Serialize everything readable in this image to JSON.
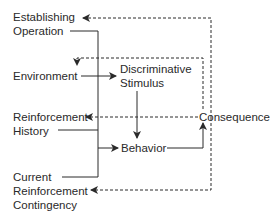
{
  "diagram": {
    "nodes": {
      "establishing_operation": {
        "line1": "Establishing",
        "line2": "Operation"
      },
      "environment": {
        "label": "Environment"
      },
      "discriminative_stimulus": {
        "line1": "Discriminative",
        "line2": "Stimulus"
      },
      "reinforcement_history": {
        "line1": "Reinforcement",
        "line2": "History"
      },
      "behavior": {
        "label": "Behavior"
      },
      "consequence": {
        "label": "Consequence"
      },
      "current_reinforcement_contingency": {
        "line1": "Current",
        "line2": "Reinforcement",
        "line3": "Contingency"
      }
    },
    "edges": [
      {
        "from": "Environment",
        "to": "Discriminative Stimulus",
        "style": "solid"
      },
      {
        "from": "Discriminative Stimulus",
        "to": "Behavior",
        "style": "solid"
      },
      {
        "from": "Establishing Operation / Reinforcement History / Current Reinforcement Contingency",
        "to": "Behavior",
        "style": "solid"
      },
      {
        "from": "Behavior",
        "to": "Consequence",
        "style": "solid"
      },
      {
        "from": "Consequence",
        "to": "Establishing Operation",
        "style": "dashed"
      },
      {
        "from": "Consequence",
        "to": "Environment",
        "style": "dashed"
      },
      {
        "from": "Consequence",
        "to": "Reinforcement History",
        "style": "dashed"
      },
      {
        "from": "Consequence",
        "to": "Current Reinforcement Contingency",
        "style": "dashed"
      }
    ],
    "colors": {
      "line": "#2a2a2a",
      "text": "#2a2a2a",
      "background": "#ffffff"
    }
  }
}
